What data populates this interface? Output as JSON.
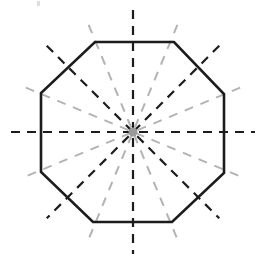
{
  "figure": {
    "kind": "geometry-diagram",
    "canvas": {
      "width": 264,
      "height": 263,
      "background": "#ffffff"
    },
    "center": {
      "x": 133,
      "y": 132,
      "label": "center-point",
      "dot_color": "#9a9a9a",
      "dot_radius": 4.5
    },
    "polygon": {
      "name": "octagon",
      "sides": 8,
      "stroke": "#1c1c1c",
      "stroke_width": 2.6,
      "fill": "none",
      "circumradius": 97,
      "rotation_deg": 22.5,
      "vertices": [
        {
          "x": 95,
          "y": 42
        },
        {
          "x": 174,
          "y": 42
        },
        {
          "x": 224,
          "y": 94
        },
        {
          "x": 224,
          "y": 173
        },
        {
          "x": 172,
          "y": 222
        },
        {
          "x": 93,
          "y": 222
        },
        {
          "x": 41,
          "y": 172
        },
        {
          "x": 41,
          "y": 93
        }
      ]
    },
    "symmetry_lines": {
      "count": 8,
      "description": "Eight dashed lines of symmetry through the center, spaced 22.5 degrees apart; four pass through opposite vertices and four bisect opposite edges.",
      "dark": {
        "color": "#1c1c1c",
        "stroke_width": 2.2,
        "dash": "9 7",
        "angles_deg": [
          0,
          45,
          90,
          135
        ],
        "half_length": 122
      },
      "light": {
        "color": "#b3b3b3",
        "stroke_width": 2.0,
        "dash": "9 8",
        "angles_deg": [
          22.5,
          67.5,
          112.5,
          157.5
        ],
        "half_length": 116
      }
    },
    "artifact": {
      "name": "scan-speck",
      "x": 37,
      "y": 1,
      "color": "#d8d8d8"
    }
  }
}
